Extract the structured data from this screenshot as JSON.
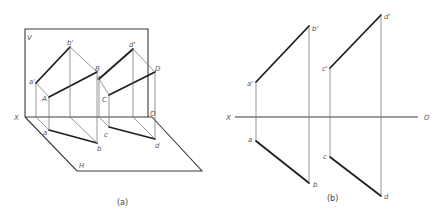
{
  "figure": {
    "panel_a": {
      "caption": "(a)",
      "plane_labels": {
        "V": "V",
        "H": "H",
        "X": "X",
        "O": "O"
      },
      "point_labels": {
        "a_prime": "a'",
        "b_prime": "b'",
        "c_prime": "c'",
        "d_prime": "d'",
        "A": "A",
        "B": "B",
        "C": "C",
        "D": "D",
        "a": "a",
        "b": "b",
        "c": "c",
        "d": "d"
      }
    },
    "panel_b": {
      "caption": "(b)",
      "axis_labels": {
        "X": "X",
        "O": "O"
      },
      "point_labels": {
        "a_prime": "a'",
        "b_prime": "b'",
        "c_prime": "c'",
        "d_prime": "d'",
        "a": "a",
        "b": "b",
        "c": "c",
        "d": "d"
      }
    },
    "colors": {
      "background": "#ffffff",
      "bold_line": "#1e1e1e",
      "thin_line": "#6a6a6a",
      "label": "#555555"
    }
  }
}
